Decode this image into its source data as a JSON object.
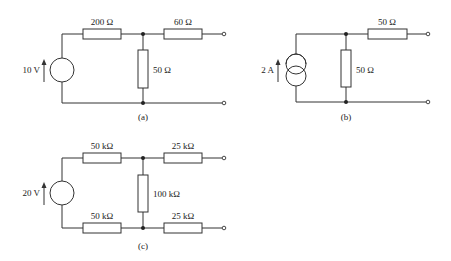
{
  "figure": {
    "circuits": [
      {
        "id": "a",
        "caption": "(a)",
        "source": {
          "type": "voltage",
          "value": "10 V",
          "direction": "up"
        },
        "resistors": {
          "series_top": "200 Ω",
          "output_top": "60 Ω",
          "shunt": "50 Ω"
        }
      },
      {
        "id": "b",
        "caption": "(b)",
        "source": {
          "type": "current",
          "value": "2 A",
          "direction": "up"
        },
        "resistors": {
          "shunt": "50 Ω",
          "output_top": "50 Ω"
        }
      },
      {
        "id": "c",
        "caption": "(c)",
        "source": {
          "type": "voltage",
          "value": "20 V",
          "direction": "up"
        },
        "resistors": {
          "series_top": "50 kΩ",
          "series_bottom": "50 kΩ",
          "shunt": "100 kΩ",
          "output_top": "25 kΩ",
          "output_bottom": "25 kΩ"
        }
      }
    ]
  }
}
